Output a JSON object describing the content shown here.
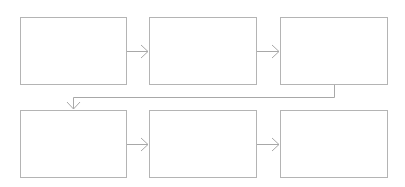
{
  "diagram": {
    "type": "process-flow",
    "line_color": "#b0b0b0",
    "border_color": "#b4b4b4",
    "rows": 2,
    "columns": 3,
    "boxes": [
      {
        "id": "step-1",
        "row": 1,
        "col": 1,
        "label": "",
        "x": 20,
        "y": 17,
        "w": 107,
        "h": 68
      },
      {
        "id": "step-2",
        "row": 1,
        "col": 2,
        "label": "",
        "x": 149,
        "y": 17,
        "w": 108,
        "h": 68
      },
      {
        "id": "step-3",
        "row": 1,
        "col": 3,
        "label": "",
        "x": 280,
        "y": 17,
        "w": 108,
        "h": 68
      },
      {
        "id": "step-4",
        "row": 2,
        "col": 1,
        "label": "",
        "x": 20,
        "y": 110,
        "w": 107,
        "h": 68
      },
      {
        "id": "step-5",
        "row": 2,
        "col": 2,
        "label": "",
        "x": 149,
        "y": 110,
        "w": 108,
        "h": 68
      },
      {
        "id": "step-6",
        "row": 2,
        "col": 3,
        "label": "",
        "x": 280,
        "y": 110,
        "w": 108,
        "h": 68
      }
    ],
    "connectors": [
      {
        "from": "step-1",
        "to": "step-2",
        "direction": "right"
      },
      {
        "from": "step-2",
        "to": "step-3",
        "direction": "right"
      },
      {
        "from": "step-3",
        "to": "step-4",
        "direction": "elbow-down-left-down"
      },
      {
        "from": "step-4",
        "to": "step-5",
        "direction": "right"
      },
      {
        "from": "step-5",
        "to": "step-6",
        "direction": "right"
      }
    ]
  }
}
